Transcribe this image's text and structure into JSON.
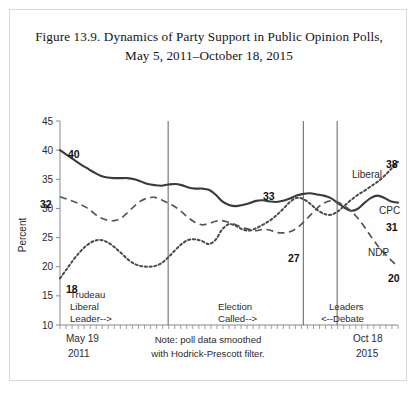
{
  "figure": {
    "title_line1": "Figure 13.9. Dynamics of Party Support in Public Opinion Polls,",
    "title_line2": "May 5, 2011–October 18, 2015"
  },
  "note": {
    "line1": "Note: poll data smoothed",
    "line2": "with Hodrick-Prescott filter."
  },
  "annotations": {
    "trudeau": {
      "line1": "Trudeau",
      "line2": "Liberal",
      "line3": "Leader-->"
    },
    "election": {
      "line1": "Election",
      "line2": "Called-->"
    },
    "debate": {
      "line1": "Leaders",
      "line2": "<--Debate"
    }
  },
  "xaxis": {
    "left_line1": "May 19",
    "left_line2": "2011",
    "right_line1": "Oct 18",
    "right_line2": "2015"
  },
  "colors": {
    "cpc": "#3a3a3a",
    "ndp": "#555555",
    "liberal": "#4a4a4a",
    "axis": "#8a8a8a",
    "vline": "#6f6f6f",
    "text": "#2b2b2b"
  },
  "chart_data": {
    "type": "line",
    "title": "Figure 13.9. Dynamics of Party Support in Public Opinion Polls, May 5, 2011–October 18, 2015",
    "xlabel": "",
    "ylabel": "Percent",
    "ylim": [
      10,
      45
    ],
    "yticks": [
      10,
      15,
      20,
      25,
      30,
      35,
      40,
      45
    ],
    "xlim": [
      0,
      100
    ],
    "x_start_label": "May 19 2011",
    "x_end_label": "Oct 18 2015",
    "grid": false,
    "legend": "inline-labels",
    "series": [
      {
        "name": "CPC",
        "label": "CPC",
        "style": "solid",
        "start_value": 40,
        "end_value": 31,
        "x": [
          0,
          2,
          4,
          6,
          8,
          10,
          12,
          14,
          16,
          18,
          20,
          22,
          24,
          26,
          28,
          30,
          32,
          34,
          36,
          38,
          40,
          42,
          44,
          46,
          48,
          50,
          52,
          54,
          56,
          58,
          60,
          62,
          64,
          66,
          68,
          70,
          72,
          74,
          76,
          78,
          80,
          82,
          84,
          86,
          88,
          90,
          92,
          94,
          96,
          98,
          100
        ],
        "values": [
          40.0,
          39.2,
          38.4,
          37.6,
          36.9,
          36.2,
          35.6,
          35.3,
          35.2,
          35.2,
          35.2,
          35.0,
          34.6,
          34.2,
          34.0,
          33.9,
          34.1,
          34.2,
          34.0,
          33.6,
          33.4,
          33.4,
          33.2,
          32.4,
          31.2,
          30.6,
          30.4,
          30.6,
          30.9,
          31.3,
          31.4,
          31.2,
          31.1,
          31.3,
          31.7,
          32.2,
          32.5,
          32.6,
          32.4,
          32.2,
          31.8,
          31.0,
          30.2,
          29.6,
          29.9,
          30.9,
          31.8,
          32.2,
          31.8,
          31.2,
          31.0
        ],
        "annotated_points": [
          {
            "label": "40",
            "value": 40,
            "position": "start"
          },
          {
            "label": "33",
            "value": 33,
            "position": "mid"
          },
          {
            "label": "31",
            "value": 31,
            "position": "end"
          }
        ]
      },
      {
        "name": "NDP",
        "label": "NDP",
        "style": "dashed",
        "start_value": 32,
        "end_value": 20,
        "x": [
          0,
          2,
          4,
          6,
          8,
          10,
          12,
          14,
          16,
          18,
          20,
          22,
          24,
          26,
          28,
          30,
          32,
          34,
          36,
          38,
          40,
          42,
          44,
          46,
          48,
          50,
          52,
          54,
          56,
          58,
          60,
          62,
          64,
          66,
          68,
          70,
          72,
          74,
          76,
          78,
          80,
          82,
          84,
          86,
          88,
          90,
          92,
          94,
          96,
          98,
          100
        ],
        "values": [
          32.0,
          31.6,
          31.2,
          30.7,
          30.1,
          29.2,
          28.4,
          28.0,
          27.9,
          28.3,
          29.3,
          30.4,
          31.3,
          31.8,
          31.9,
          31.5,
          30.9,
          30.3,
          29.4,
          28.4,
          27.6,
          27.2,
          27.4,
          27.8,
          27.9,
          27.6,
          27.2,
          26.7,
          26.4,
          26.2,
          26.4,
          26.3,
          25.9,
          25.8,
          26.0,
          26.6,
          27.6,
          28.8,
          30.0,
          30.9,
          31.3,
          31.1,
          30.5,
          29.6,
          28.4,
          26.9,
          25.2,
          23.6,
          22.3,
          21.1,
          20.0
        ],
        "annotated_points": [
          {
            "label": "32",
            "value": 32,
            "position": "start"
          },
          {
            "label": "27",
            "value": 27,
            "position": "mid"
          },
          {
            "label": "20",
            "value": 20,
            "position": "end"
          }
        ]
      },
      {
        "name": "Liberal",
        "label": "Liberal",
        "style": "dotted",
        "start_value": 18,
        "end_value": 38,
        "x": [
          0,
          2,
          4,
          6,
          8,
          10,
          12,
          14,
          16,
          18,
          20,
          22,
          24,
          26,
          28,
          30,
          32,
          34,
          36,
          38,
          40,
          42,
          44,
          46,
          48,
          50,
          52,
          54,
          56,
          58,
          60,
          62,
          64,
          66,
          68,
          70,
          72,
          74,
          76,
          78,
          80,
          82,
          84,
          86,
          88,
          90,
          92,
          94,
          96,
          98,
          100
        ],
        "values": [
          18.0,
          19.6,
          21.2,
          22.6,
          23.7,
          24.4,
          24.6,
          24.2,
          23.4,
          22.4,
          21.3,
          20.5,
          20.1,
          20.0,
          20.1,
          20.6,
          21.6,
          22.8,
          23.9,
          24.6,
          24.7,
          24.4,
          23.9,
          24.6,
          26.4,
          27.3,
          27.0,
          26.4,
          26.2,
          26.6,
          27.2,
          27.9,
          28.8,
          29.9,
          31.1,
          31.8,
          31.6,
          30.8,
          29.8,
          29.1,
          28.9,
          29.4,
          30.4,
          31.4,
          32.3,
          33.0,
          33.8,
          34.6,
          35.6,
          36.8,
          38.0
        ],
        "annotated_points": [
          {
            "label": "18",
            "value": 18,
            "position": "start"
          },
          {
            "label": "38",
            "value": 38,
            "position": "end"
          }
        ]
      }
    ],
    "vlines": [
      {
        "name": "trudeau-liberal-leader",
        "x": 32,
        "label": "Trudeau Liberal Leader-->"
      },
      {
        "name": "election-called",
        "x": 72,
        "label": "Election Called-->"
      },
      {
        "name": "leaders-debate",
        "x": 82,
        "label": "Leaders <--Debate"
      }
    ]
  }
}
